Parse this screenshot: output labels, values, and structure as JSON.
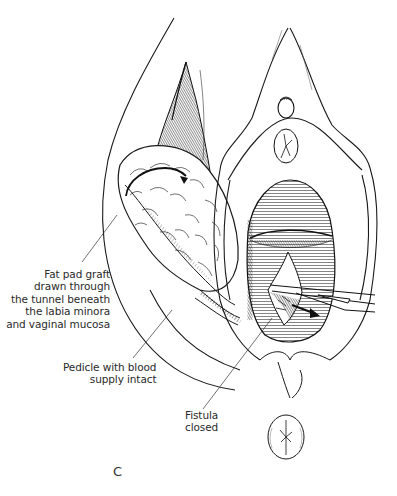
{
  "figure": {
    "panel_letter": "C",
    "labels": {
      "fat_pad": [
        "Fat pad graft",
        "drawn through",
        "the tunnel beneath",
        "the labia minora",
        "and vaginal mucosa"
      ],
      "pedicle": [
        "Pedicle with blood",
        "supply intact"
      ],
      "fistula": [
        "Fistula",
        "closed"
      ]
    },
    "colors": {
      "ink": "#1a1a1a",
      "background": "#ffffff",
      "label_text": "#2a2a2a"
    }
  }
}
